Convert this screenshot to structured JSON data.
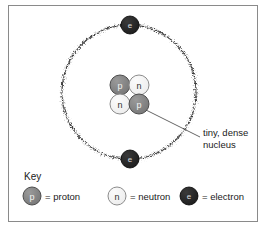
{
  "figure": {
    "background_color": "#ffffff",
    "border_color": "#8a8a8a"
  },
  "colors": {
    "proton_fill": "#808080",
    "proton_stroke": "#4d4d4d",
    "neutron_fill": "#f2f2f2",
    "neutron_stroke": "#8c8c8c",
    "electron_fill": "#262626",
    "electron_stroke": "#000000",
    "orbit_stroke": "#2b2b2b",
    "leader_line": "#555555",
    "text": "#1a1a1a"
  },
  "nucleus": {
    "particles": [
      {
        "symbol": "p",
        "type": "proton",
        "cx": 120,
        "cy": 85
      },
      {
        "symbol": "n",
        "type": "neutron",
        "cx": 139,
        "cy": 85
      },
      {
        "symbol": "n",
        "type": "neutron",
        "cx": 120,
        "cy": 104
      },
      {
        "symbol": "p",
        "type": "proton",
        "cx": 139,
        "cy": 104
      }
    ],
    "radius": 10
  },
  "orbit": {
    "center_x": 129,
    "center_y": 92,
    "radius": 67,
    "electrons": [
      {
        "symbol": "e",
        "type": "electron",
        "cx": 130,
        "cy": 25
      },
      {
        "symbol": "e",
        "type": "electron",
        "cx": 130,
        "cy": 159
      }
    ],
    "electron_radius": 9
  },
  "callout": {
    "label_line1": "tiny, dense",
    "label_line2": "nucleus",
    "line_from_x": 146,
    "line_from_y": 110,
    "line_to_x": 200,
    "line_to_y": 137,
    "text_x": 203,
    "text_y": 136
  },
  "key": {
    "heading": "Key",
    "heading_x": 24,
    "heading_y": 180,
    "entries": [
      {
        "symbol": "p",
        "type": "proton",
        "label": "= proton",
        "cx": 32,
        "cy": 196,
        "text_x": 45,
        "text_y": 197
      },
      {
        "symbol": "n",
        "type": "neutron",
        "label": "= neutron",
        "cx": 117,
        "cy": 196,
        "text_x": 130,
        "text_y": 197
      },
      {
        "symbol": "e",
        "type": "electron",
        "label": "= electron",
        "cx": 189,
        "cy": 196,
        "text_x": 202,
        "text_y": 197
      }
    ],
    "radius": 9
  }
}
